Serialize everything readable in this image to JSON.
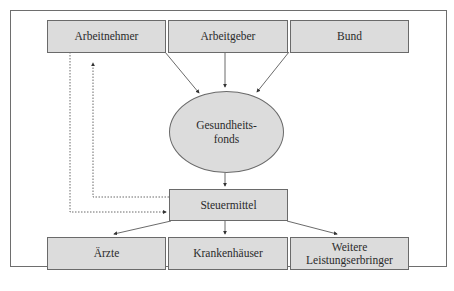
{
  "diagram": {
    "top_row": [
      {
        "id": "arbeitnehmer",
        "label": "Arbeitnehmer"
      },
      {
        "id": "arbeitgeber",
        "label": "Arbeitgeber"
      },
      {
        "id": "bund",
        "label": "Bund"
      }
    ],
    "center": {
      "id": "gesundheitsfonds",
      "label": "Gesundheits-\nfonds"
    },
    "middle": {
      "id": "steuermittel",
      "label": "Steuermittel"
    },
    "bottom_row": [
      {
        "id": "aerzte",
        "label": "Ärzte"
      },
      {
        "id": "krankenhaeuser",
        "label": "Krankenhäuser"
      },
      {
        "id": "weitere",
        "label": "Weitere\nLeistungserbringer"
      }
    ],
    "edges": [
      {
        "from": "arbeitnehmer",
        "to": "gesundheitsfonds",
        "style": "solid"
      },
      {
        "from": "arbeitgeber",
        "to": "gesundheitsfonds",
        "style": "solid"
      },
      {
        "from": "bund",
        "to": "gesundheitsfonds",
        "style": "solid"
      },
      {
        "from": "gesundheitsfonds",
        "to": "steuermittel",
        "style": "solid"
      },
      {
        "from": "steuermittel",
        "to": "aerzte",
        "style": "solid"
      },
      {
        "from": "steuermittel",
        "to": "krankenhaeuser",
        "style": "solid"
      },
      {
        "from": "steuermittel",
        "to": "weitere",
        "style": "solid"
      },
      {
        "from": "arbeitnehmer",
        "to": "steuermittel",
        "style": "dotted"
      },
      {
        "from": "steuermittel",
        "to": "arbeitnehmer",
        "style": "dotted"
      }
    ],
    "colors": {
      "box_fill": "#dcdcdc",
      "border": "#6a6a6a",
      "line": "#3a3a3a"
    }
  }
}
